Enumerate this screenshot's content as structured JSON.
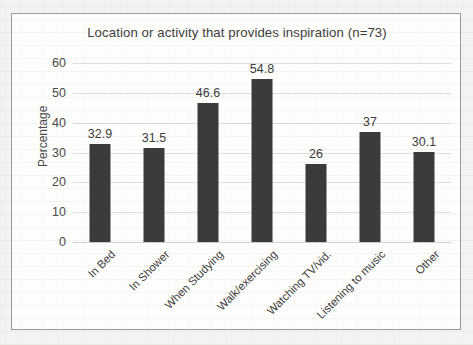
{
  "chart_data": {
    "type": "bar",
    "title": "Location or activity that provides inspiration (n=73)",
    "xlabel": "",
    "ylabel": "Percentage",
    "ylim": [
      0,
      60
    ],
    "yticks": [
      0,
      10,
      20,
      30,
      40,
      50,
      60
    ],
    "grid": true,
    "legend": false,
    "bar_color": "#3b3b3b",
    "categories": [
      "In Bed",
      "In Shower",
      "When Studying",
      "Walk/exercising",
      "Watching TV/vid.",
      "Listening to music",
      "Other"
    ],
    "values": [
      32.9,
      31.5,
      46.6,
      54.8,
      26,
      37,
      30.1
    ],
    "value_labels": [
      "32.9",
      "31.5",
      "46.6",
      "54.8",
      "26",
      "37",
      "30.1"
    ]
  }
}
